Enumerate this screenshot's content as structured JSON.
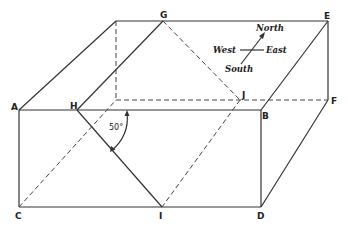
{
  "figure": {
    "vertices": {
      "A": "A",
      "B": "B",
      "C": "C",
      "D": "D",
      "E": "E",
      "F": "F",
      "G": "G",
      "H": "H",
      "I": "I",
      "J": "J"
    },
    "angle_label": "50°",
    "compass": {
      "north": "North",
      "south": "South",
      "east": "East",
      "west": "West"
    }
  },
  "colors": {
    "line": "#333333",
    "background": "#ffffff"
  }
}
